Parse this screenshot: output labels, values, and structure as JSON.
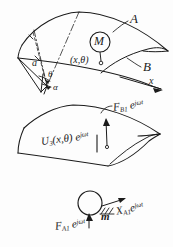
{
  "figure": {
    "ink_color": "#1b1b1b",
    "background_color": "#fdfdfd",
    "labels": {
      "shell_a": "A",
      "shell_b": "B",
      "mass_marker": "M",
      "coordinate_point": "(x,θ)",
      "radius_a": "a",
      "angle_theta": "θ",
      "angle_alpha": "α",
      "axis_x": "x",
      "force_b1": "F",
      "force_b1_sub": "B1",
      "force_b1_exp": "e",
      "exp_term": "jωt",
      "displacement_u3": "U",
      "displacement_u3_sub": "3",
      "displacement_u3_arg": "(x,θ)",
      "displacement_u3_exp": "e",
      "force_a1": "F",
      "force_a1_sub": "A1",
      "force_a1_exp": "e",
      "mass_m": "m",
      "disp_xa1": "X",
      "disp_xa1_sub": "A1",
      "disp_xa1_exp": "e"
    },
    "annotations": {
      "upper_surface": "fan-shaped curved shell panel A with point mass M at (x,θ)",
      "middle_surface": "second shell panel showing radial displacement field",
      "lower_sketch": "lumped mass oscillator with forces F_A1 and displacement X_A1"
    }
  }
}
